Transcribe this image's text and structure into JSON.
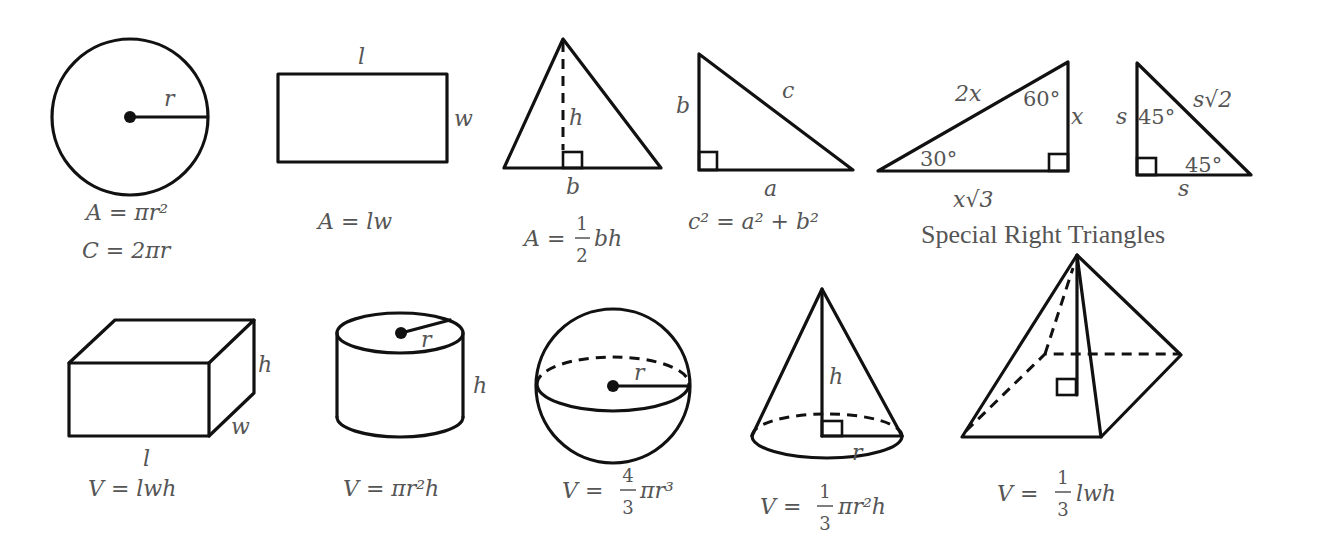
{
  "colors": {
    "stroke": "#111111",
    "text": "#555555",
    "background": "#ffffff"
  },
  "shapes_2d": {
    "circle": {
      "label_radius": "r",
      "formula_area": "A = πr²",
      "formula_circumference": "C = 2πr"
    },
    "rectangle": {
      "label_length": "l",
      "label_width": "w",
      "formula_area": "A = lw"
    },
    "triangle": {
      "label_height": "h",
      "label_base": "b",
      "formula_lhs": "A =",
      "frac_num": "1",
      "frac_den": "2",
      "formula_rhs": "bh"
    },
    "right_triangle": {
      "label_a": "a",
      "label_b": "b",
      "label_c": "c",
      "formula": "c² = a² + b²"
    },
    "special_30_60_90": {
      "hyp": "2x",
      "short_leg": "x",
      "long_leg": "x√3",
      "angle_small": "30°",
      "angle_large": "60°"
    },
    "special_45_45_90": {
      "leg_vertical": "s",
      "leg_horizontal": "s",
      "hyp": "s√2",
      "angle_top": "45°",
      "angle_bottom": "45°"
    },
    "special_caption": "Special Right Triangles"
  },
  "shapes_3d": {
    "prism": {
      "label_l": "l",
      "label_w": "w",
      "label_h": "h",
      "formula": "V = lwh"
    },
    "cylinder": {
      "label_r": "r",
      "label_h": "h",
      "formula": "V = πr²h"
    },
    "sphere": {
      "label_r": "r",
      "formula_lhs": "V =",
      "frac_num": "4",
      "frac_den": "3",
      "formula_rhs": "πr³"
    },
    "cone": {
      "label_h": "h",
      "label_r": "r",
      "formula_lhs": "V =",
      "frac_num": "1",
      "frac_den": "3",
      "formula_rhs": "πr²h"
    },
    "pyramid": {
      "formula_lhs": "V =",
      "frac_num": "1",
      "frac_den": "3",
      "formula_rhs": "lwh"
    }
  }
}
